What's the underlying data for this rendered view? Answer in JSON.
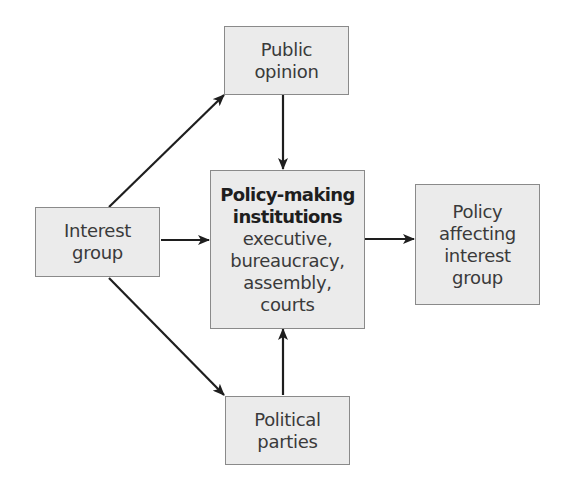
{
  "diagram": {
    "type": "flowchart",
    "colors": {
      "node_fill": "#ebebeb",
      "node_border": "#8a8a8a",
      "text": "#3a3a3a",
      "arrow": "#1e1e1e"
    },
    "nodes": {
      "public_opinion": {
        "lines": [
          "Public",
          "opinion"
        ]
      },
      "interest_group": {
        "lines": [
          "Interest",
          "group"
        ]
      },
      "policy_making": {
        "title_lines": [
          "Policy-making",
          "institutions"
        ],
        "lines": [
          "executive,",
          "bureaucracy,",
          "assembly,",
          "courts"
        ]
      },
      "policy_affecting": {
        "lines": [
          "Policy",
          "affecting",
          "interest",
          "group"
        ]
      },
      "political_parties": {
        "lines": [
          "Political",
          "parties"
        ]
      }
    },
    "edges": [
      {
        "from": "Interest group",
        "to": "Public opinion"
      },
      {
        "from": "Interest group",
        "to": "Policy-making institutions"
      },
      {
        "from": "Interest group",
        "to": "Political parties"
      },
      {
        "from": "Public opinion",
        "to": "Policy-making institutions"
      },
      {
        "from": "Political parties",
        "to": "Policy-making institutions"
      },
      {
        "from": "Policy-making institutions",
        "to": "Policy affecting interest group"
      }
    ]
  }
}
